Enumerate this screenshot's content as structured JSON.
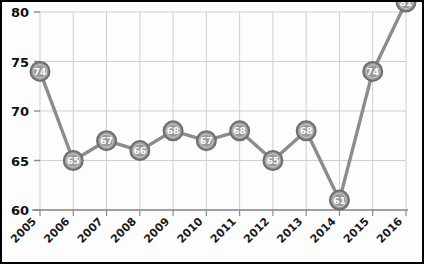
{
  "chart_data": {
    "type": "line",
    "title": "",
    "subtitle": "",
    "xlabel": "",
    "ylabel": "",
    "categories": [
      "2005",
      "2006",
      "2007",
      "2008",
      "2009",
      "2010",
      "2011",
      "2012",
      "2013",
      "2014",
      "2015",
      "2016"
    ],
    "values": [
      74,
      65,
      67,
      66,
      68,
      67,
      68,
      65,
      68,
      61,
      74,
      81
    ],
    "series": [
      {
        "name": "",
        "values": [
          74,
          65,
          67,
          66,
          68,
          67,
          68,
          65,
          68,
          61,
          74,
          81
        ]
      }
    ],
    "point_labels": [
      "74",
      "65",
      "67",
      "66",
      "68",
      "67",
      "68",
      "65",
      "68",
      "61",
      "74",
      "81"
    ],
    "ylim": [
      60,
      80
    ],
    "yticks": [
      60,
      65,
      70,
      75,
      80
    ],
    "ytick_labels": [
      "60",
      "65",
      "70",
      "75",
      "80"
    ],
    "xtick_labels": [
      "2005",
      "2006",
      "2007",
      "2008",
      "2009",
      "2010",
      "2011",
      "2012",
      "2013",
      "2014",
      "2015",
      "2016"
    ],
    "grid": true,
    "grid_axes": "both",
    "legend": false,
    "legend_position": "none",
    "annotations": [],
    "xtick_rotation": 45
  },
  "style": {
    "line_color": "#8c8c8c",
    "marker_fill": "#999999",
    "marker_ring": "#6e6e6e",
    "marker_text_color": "#ffffff",
    "grid_color": "#cfcfcf",
    "axis_color": "#8a8a8a",
    "tick_label_color": "#111111",
    "background": "#fdfdfd",
    "border_color": "#000000"
  }
}
